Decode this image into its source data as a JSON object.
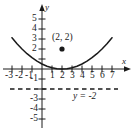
{
  "chart_data": {
    "type": "line",
    "title": "",
    "xlabel": "x",
    "ylabel": "y",
    "xlim": [
      -3.8,
      8.2
    ],
    "ylim": [
      -5.8,
      5.8
    ],
    "grid": false,
    "legend": "none",
    "x_ticks": [
      -3,
      -2,
      -1,
      1,
      2,
      3,
      4,
      5,
      6,
      7
    ],
    "x_tick_labels": [
      "-3",
      "-2",
      "-1",
      "1",
      "2",
      "3",
      "4",
      "5",
      "6",
      "7"
    ],
    "y_ticks": [
      5,
      4,
      3,
      2,
      -1,
      -3,
      -4,
      -5
    ],
    "y_tick_labels": [
      "5",
      "4",
      "3",
      "2",
      "-1",
      "-3",
      "-4",
      "-5"
    ],
    "series": [
      {
        "name": "parabola",
        "type": "curve",
        "equation": "y = (x - 2)^2 / 8",
        "vertex": [
          2,
          0
        ],
        "x_range": [
          -3,
          7
        ],
        "color": "#1a1a1a",
        "points": [
          [
            -3,
            3.13
          ],
          [
            -2.5,
            2.53
          ],
          [
            -2,
            2.0
          ],
          [
            -1.5,
            1.53
          ],
          [
            -1,
            1.13
          ],
          [
            -0.5,
            0.78
          ],
          [
            0,
            0.5
          ],
          [
            0.5,
            0.28
          ],
          [
            1,
            0.13
          ],
          [
            1.5,
            0.03
          ],
          [
            2,
            0
          ],
          [
            2.5,
            0.03
          ],
          [
            3,
            0.13
          ],
          [
            3.5,
            0.28
          ],
          [
            4,
            0.5
          ],
          [
            4.5,
            0.78
          ],
          [
            5,
            1.13
          ],
          [
            5.5,
            1.53
          ],
          [
            6,
            2.0
          ],
          [
            6.5,
            2.53
          ],
          [
            7,
            3.13
          ]
        ]
      },
      {
        "name": "directrix",
        "type": "dashed-horizontal",
        "y_value": -2,
        "x_range": [
          -3.2,
          7.6
        ],
        "color": "#1a1a1a"
      }
    ],
    "points": [
      {
        "name": "focus-point",
        "x": 2,
        "y": 2,
        "label": "(2, 2)",
        "marker": "filled-circle",
        "color": "#1a1a1a"
      }
    ],
    "annotations": [
      {
        "name": "directrix-label",
        "text": "y = -2",
        "x": 4.6,
        "y": -2.6
      },
      {
        "name": "x-axis-label",
        "text": "x",
        "x": 8.0,
        "y": 0.9
      },
      {
        "name": "y-axis-label",
        "text": "y",
        "x": 0.55,
        "y": 5.6
      }
    ],
    "axis_color": "#1a1a1a"
  },
  "figure": {
    "x_axis_label": "x",
    "y_axis_label": "y",
    "directrix_label": "y = -2",
    "point_label": "(2, 2)",
    "x_tick_neg3": "-3",
    "x_tick_neg2": "-2",
    "x_tick_neg1": "-1",
    "x_tick_1": "1",
    "x_tick_2": "2",
    "x_tick_3": "3",
    "x_tick_4": "4",
    "x_tick_5": "5",
    "x_tick_6": "6",
    "x_tick_7": "7",
    "y_tick_5": "5",
    "y_tick_4": "4",
    "y_tick_3": "3",
    "y_tick_2": "2",
    "y_tick_neg1": "-1",
    "y_tick_neg3": "-3",
    "y_tick_neg4": "-4",
    "y_tick_neg5": "-5"
  }
}
